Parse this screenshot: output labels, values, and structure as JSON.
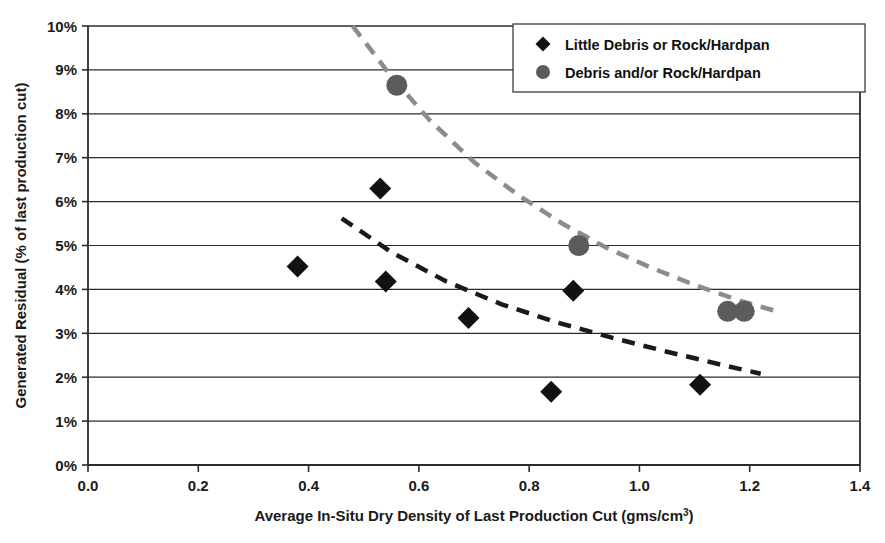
{
  "chart_data": {
    "type": "scatter",
    "title": "",
    "xlabel": "Average In-Situ Dry Density of Last Production Cut (gms/cm",
    "xlabel_superscript": "3",
    "xlabel_suffix": ")",
    "ylabel": "Generated Residual (% of last production cut)",
    "xlim": [
      0.0,
      1.4
    ],
    "ylim": [
      0.0,
      10.0
    ],
    "xticks": [
      "0.0",
      "0.2",
      "0.4",
      "0.6",
      "0.8",
      "1.0",
      "1.2",
      "1.4"
    ],
    "xtick_values": [
      0.0,
      0.2,
      0.4,
      0.6,
      0.8,
      1.0,
      1.2,
      1.4
    ],
    "yticks": [
      "0%",
      "1%",
      "2%",
      "3%",
      "4%",
      "5%",
      "6%",
      "7%",
      "8%",
      "9%",
      "10%"
    ],
    "ytick_values": [
      0,
      1,
      2,
      3,
      4,
      5,
      6,
      7,
      8,
      9,
      10
    ],
    "grid": "horizontal",
    "legend_position": "top-right",
    "series": [
      {
        "name": "Little Debris or Rock/Hardpan",
        "marker": "diamond",
        "color": "#111111",
        "points": [
          {
            "x": 0.38,
            "y": 4.52
          },
          {
            "x": 0.53,
            "y": 6.3
          },
          {
            "x": 0.54,
            "y": 4.18
          },
          {
            "x": 0.69,
            "y": 3.35
          },
          {
            "x": 0.84,
            "y": 1.67
          },
          {
            "x": 0.88,
            "y": 3.97
          },
          {
            "x": 1.11,
            "y": 1.83
          }
        ],
        "trendline": {
          "style": "dashed",
          "color": "#1a1a1a",
          "width": 4.5,
          "points": [
            {
              "x": 0.46,
              "y": 5.62
            },
            {
              "x": 0.55,
              "y": 4.85
            },
            {
              "x": 0.65,
              "y": 4.18
            },
            {
              "x": 0.75,
              "y": 3.66
            },
            {
              "x": 0.85,
              "y": 3.25
            },
            {
              "x": 0.95,
              "y": 2.9
            },
            {
              "x": 1.05,
              "y": 2.58
            },
            {
              "x": 1.15,
              "y": 2.28
            },
            {
              "x": 1.22,
              "y": 2.08
            }
          ]
        }
      },
      {
        "name": "Debris and/or Rock/Hardpan",
        "marker": "circle",
        "color": "#5c5c5c",
        "points": [
          {
            "x": 0.56,
            "y": 8.65
          },
          {
            "x": 0.89,
            "y": 5.0
          },
          {
            "x": 1.16,
            "y": 3.5
          },
          {
            "x": 1.19,
            "y": 3.5
          }
        ],
        "trendline": {
          "style": "dashed",
          "color": "#8c8c8c",
          "width": 4.5,
          "points": [
            {
              "x": 0.48,
              "y": 10.0
            },
            {
              "x": 0.55,
              "y": 8.85
            },
            {
              "x": 0.62,
              "y": 7.85
            },
            {
              "x": 0.7,
              "y": 6.9
            },
            {
              "x": 0.78,
              "y": 6.15
            },
            {
              "x": 0.86,
              "y": 5.5
            },
            {
              "x": 0.94,
              "y": 4.95
            },
            {
              "x": 1.02,
              "y": 4.5
            },
            {
              "x": 1.1,
              "y": 4.1
            },
            {
              "x": 1.18,
              "y": 3.75
            },
            {
              "x": 1.25,
              "y": 3.5
            }
          ]
        }
      }
    ],
    "legend": [
      {
        "label": "Little Debris or Rock/Hardpan",
        "marker": "diamond",
        "color": "#111111"
      },
      {
        "label": "Debris and/or Rock/Hardpan",
        "marker": "circle",
        "color": "#5c5c5c"
      }
    ]
  }
}
